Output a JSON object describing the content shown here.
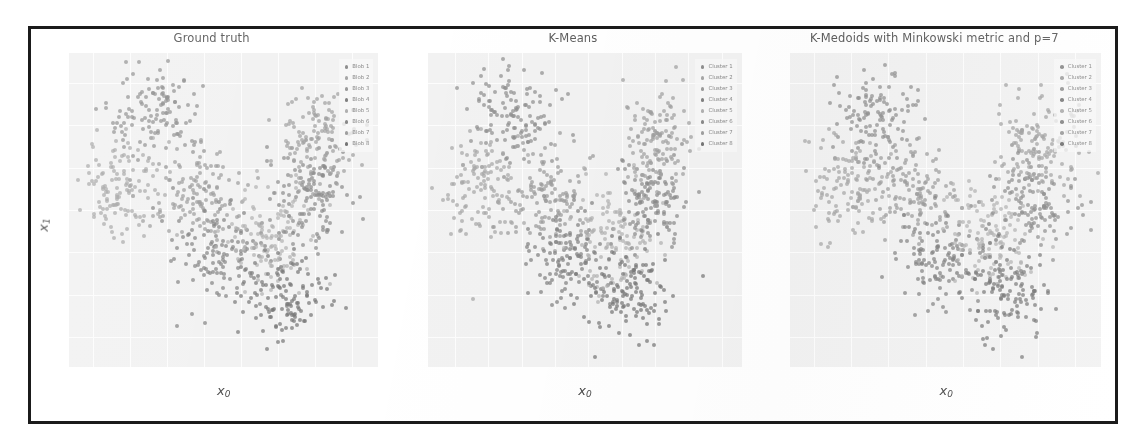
{
  "figure": {
    "border_color": "#1b1b1b",
    "background": "#ffffff",
    "plot_background": "#f2f2f2",
    "grid_color": "#fdfdfd"
  },
  "chart_data": [
    {
      "type": "scatter",
      "title": "Ground truth",
      "xlabel": "x0",
      "ylabel": "x1",
      "xlim": [
        -9.3,
        7.4
      ],
      "ylim": [
        -9.4,
        5.4
      ],
      "xticks": [
        -8,
        -6,
        -4,
        -2,
        0,
        2,
        4,
        6
      ],
      "yticks": [
        4,
        2,
        0,
        -2,
        -4,
        -6,
        -8
      ],
      "grid": true,
      "legend_position": "upper right",
      "series": [
        {
          "name": "Blob 1",
          "color": "#8f8f8f",
          "n": 125,
          "cx": -4.6,
          "cy": 2.5,
          "sx": 1.25,
          "sy": 1.15
        },
        {
          "name": "Blob 2",
          "color": "#a6a6a6",
          "n": 125,
          "cx": -6.3,
          "cy": -0.9,
          "sx": 1.05,
          "sy": 1.1
        },
        {
          "name": "Blob 3",
          "color": "#9a9a9a",
          "n": 125,
          "cx": -2.4,
          "cy": -1.4,
          "sx": 1.1,
          "sy": 1.2
        },
        {
          "name": "Blob 4",
          "color": "#818181",
          "n": 125,
          "cx": -1.1,
          "cy": -4.2,
          "sx": 1.25,
          "sy": 1.15
        },
        {
          "name": "Blob 5",
          "color": "#b0b0b0",
          "n": 125,
          "cx": 1.6,
          "cy": -3.3,
          "sx": 1.15,
          "sy": 1.2
        },
        {
          "name": "Blob 6",
          "color": "#8a8a8a",
          "n": 125,
          "cx": 3.9,
          "cy": -1.5,
          "sx": 1.1,
          "sy": 1.25
        },
        {
          "name": "Blob 7",
          "color": "#9f9f9f",
          "n": 125,
          "cx": 4.2,
          "cy": 1.3,
          "sx": 1.05,
          "sy": 1.15
        },
        {
          "name": "Blob 8",
          "color": "#767676",
          "n": 125,
          "cx": 2.3,
          "cy": -6.0,
          "sx": 1.2,
          "sy": 1.1
        }
      ]
    },
    {
      "type": "scatter",
      "title": "K-Means",
      "xlabel": "x0",
      "ylabel": "x1",
      "xlim": [
        -9.6,
        9.2
      ],
      "ylim": [
        -9.4,
        5.4
      ],
      "xticks": [
        -8,
        -6,
        -4,
        -2,
        0,
        2,
        4,
        6,
        8
      ],
      "yticks": [
        4,
        2,
        0,
        -2,
        -4,
        -6,
        -8
      ],
      "grid": true,
      "legend_position": "upper right",
      "series": [
        {
          "name": "Cluster 1",
          "color": "#8f8f8f",
          "n": 125,
          "cx": -4.6,
          "cy": 2.5,
          "sx": 1.25,
          "sy": 1.15
        },
        {
          "name": "Cluster 2",
          "color": "#a6a6a6",
          "n": 125,
          "cx": -6.3,
          "cy": -0.9,
          "sx": 1.05,
          "sy": 1.1
        },
        {
          "name": "Cluster 3",
          "color": "#9a9a9a",
          "n": 125,
          "cx": -2.4,
          "cy": -1.4,
          "sx": 1.1,
          "sy": 1.2
        },
        {
          "name": "Cluster 4",
          "color": "#818181",
          "n": 125,
          "cx": -1.1,
          "cy": -4.2,
          "sx": 1.25,
          "sy": 1.15
        },
        {
          "name": "Cluster 5",
          "color": "#b0b0b0",
          "n": 125,
          "cx": 1.6,
          "cy": -3.3,
          "sx": 1.15,
          "sy": 1.2
        },
        {
          "name": "Cluster 6",
          "color": "#8a8a8a",
          "n": 125,
          "cx": 3.9,
          "cy": -1.5,
          "sx": 1.1,
          "sy": 1.25
        },
        {
          "name": "Cluster 7",
          "color": "#9f9f9f",
          "n": 125,
          "cx": 4.2,
          "cy": 1.3,
          "sx": 1.05,
          "sy": 1.15
        },
        {
          "name": "Cluster 8",
          "color": "#767676",
          "n": 125,
          "cx": 2.3,
          "cy": -6.0,
          "sx": 1.2,
          "sy": 1.1
        }
      ]
    },
    {
      "type": "scatter",
      "title": "K-Medoids with Minkowski metric and p=7",
      "xlabel": "x0",
      "ylabel": "x1",
      "xlim": [
        -9.3,
        7.4
      ],
      "ylim": [
        -9.4,
        5.4
      ],
      "xticks": [
        -8,
        -6,
        -4,
        -2,
        0,
        2,
        4,
        6
      ],
      "yticks": [
        4,
        2,
        0,
        -2,
        -4,
        -6,
        -8
      ],
      "grid": true,
      "legend_position": "upper right",
      "series": [
        {
          "name": "Cluster 1",
          "color": "#8f8f8f",
          "n": 125,
          "cx": -4.6,
          "cy": 2.5,
          "sx": 1.25,
          "sy": 1.15
        },
        {
          "name": "Cluster 2",
          "color": "#a6a6a6",
          "n": 125,
          "cx": -6.3,
          "cy": -0.9,
          "sx": 1.05,
          "sy": 1.1
        },
        {
          "name": "Cluster 3",
          "color": "#9a9a9a",
          "n": 125,
          "cx": -2.4,
          "cy": -1.4,
          "sx": 1.1,
          "sy": 1.2
        },
        {
          "name": "Cluster 4",
          "color": "#818181",
          "n": 125,
          "cx": -1.1,
          "cy": -4.2,
          "sx": 1.25,
          "sy": 1.15
        },
        {
          "name": "Cluster 5",
          "color": "#b0b0b0",
          "n": 125,
          "cx": 1.6,
          "cy": -3.3,
          "sx": 1.15,
          "sy": 1.2
        },
        {
          "name": "Cluster 6",
          "color": "#8a8a8a",
          "n": 125,
          "cx": 3.9,
          "cy": -1.5,
          "sx": 1.1,
          "sy": 1.25
        },
        {
          "name": "Cluster 7",
          "color": "#9f9f9f",
          "n": 125,
          "cx": 4.2,
          "cy": 1.3,
          "sx": 1.05,
          "sy": 1.15
        },
        {
          "name": "Cluster 8",
          "color": "#767676",
          "n": 125,
          "cx": 2.3,
          "cy": -6.0,
          "sx": 1.2,
          "sy": 1.1
        }
      ]
    }
  ]
}
